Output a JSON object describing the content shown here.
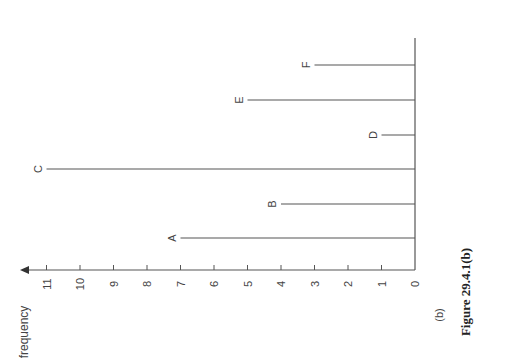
{
  "chart_data": {
    "type": "bar",
    "orientation": "rotated-90-ccw",
    "categories": [
      "A",
      "B",
      "C",
      "D",
      "E",
      "F"
    ],
    "values": [
      7,
      4,
      11,
      1,
      5,
      3
    ],
    "title": "",
    "xlabel": "",
    "ylabel": "frequency",
    "ylim": [
      0,
      11
    ],
    "yticks": [
      "0",
      "1",
      "2",
      "3",
      "4",
      "5",
      "6",
      "7",
      "8",
      "9",
      "10",
      "11"
    ],
    "grid": false,
    "legend": null,
    "bar_style": "thin vertical lines (stick diagram)",
    "sublabel": "(b)",
    "caption": "Figure 29.4.1(b)"
  },
  "labels": {
    "axis_title": "frequency",
    "sublabel": "(b)",
    "caption": "Figure 29.4.1(b)"
  }
}
